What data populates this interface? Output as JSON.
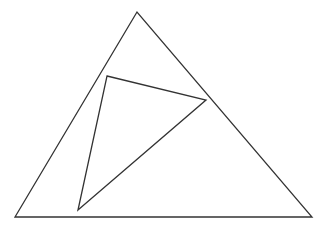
{
  "canvas": {
    "width": 329,
    "height": 226,
    "background": "#ffffff"
  },
  "stroke": {
    "color": "#333333",
    "width": 1.3
  },
  "shapes": {
    "outer_triangle": {
      "points": "137,12 15,217 312,217"
    },
    "inner_triangle": {
      "points": "107,76 206,100 78,210"
    }
  }
}
